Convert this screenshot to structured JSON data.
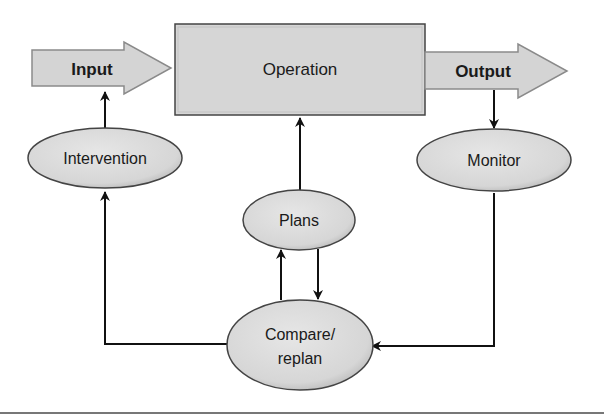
{
  "diagram": {
    "type": "control-process-flow",
    "nodes": {
      "input": {
        "label": "Input",
        "shape": "block-arrow"
      },
      "operation": {
        "label": "Operation",
        "shape": "rectangle"
      },
      "output": {
        "label": "Output",
        "shape": "block-arrow"
      },
      "intervention": {
        "label": "Intervention",
        "shape": "ellipse"
      },
      "monitor": {
        "label": "Monitor",
        "shape": "ellipse"
      },
      "plans": {
        "label": "Plans",
        "shape": "ellipse"
      },
      "compare": {
        "label_line1": "Compare/",
        "label_line2": "replan",
        "shape": "ellipse"
      }
    },
    "edges": [
      {
        "from": "Input",
        "to": "Operation"
      },
      {
        "from": "Operation",
        "to": "Output"
      },
      {
        "from": "Output",
        "to": "Monitor"
      },
      {
        "from": "Monitor",
        "to": "Compare/replan"
      },
      {
        "from": "Compare/replan",
        "to": "Intervention"
      },
      {
        "from": "Intervention",
        "to": "Input"
      },
      {
        "from": "Compare/replan",
        "to": "Plans"
      },
      {
        "from": "Plans",
        "to": "Compare/replan"
      },
      {
        "from": "Plans",
        "to": "Operation"
      }
    ],
    "colors": {
      "fill": "#d9d9d9",
      "stroke": "#333333",
      "arrow_fill": "#d4d4d4",
      "arrow_stroke": "#888888",
      "text": "#1a1a1a"
    }
  }
}
